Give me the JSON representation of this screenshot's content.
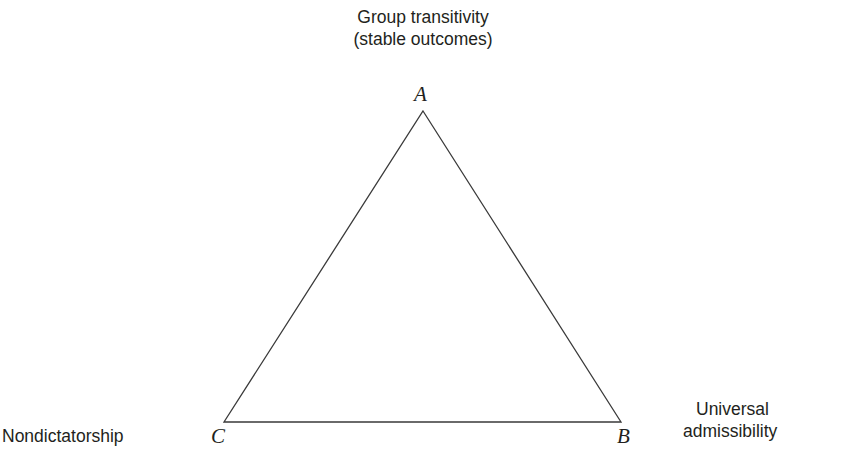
{
  "figure": {
    "kind": "impossibility-triangle-diagram",
    "background_color": "#ffffff",
    "line_color": "#3a3a3a",
    "text_color": "#231f20"
  },
  "captions": {
    "top": {
      "line_1": "Group transitivity",
      "line_2": "(stable outcomes)"
    },
    "left": {
      "line_1": "Nondictatorship"
    },
    "right": {
      "line_1": "Universal",
      "line_2": "admissibility"
    }
  },
  "vertices": [
    {
      "label": "A",
      "x": 423,
      "y": 111,
      "caption": "Group transitivity (stable outcomes)"
    },
    {
      "label": "B",
      "x": 224,
      "y": 422,
      "caption": "Nondictatorship"
    },
    {
      "label": "C",
      "x": 621,
      "y": 422,
      "caption": "Universal admissibility"
    }
  ],
  "edges": [
    {
      "from": "A",
      "to": "B"
    },
    {
      "from": "B",
      "to": "C"
    },
    {
      "from": "C",
      "to": "A"
    }
  ]
}
